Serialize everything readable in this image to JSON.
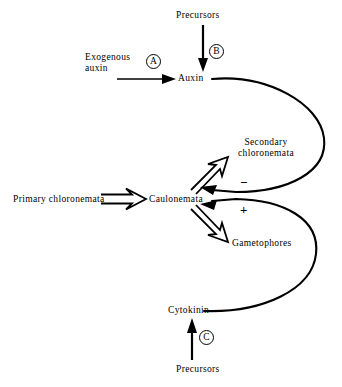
{
  "diagram": {
    "type": "flow-diagram",
    "background_color": "#ffffff",
    "line_color": "#000000",
    "nodes": [
      {
        "id": "precursors_top",
        "label": "Precursors"
      },
      {
        "id": "exogenous_auxin",
        "label": "Exogenous\nauxin",
        "line1": "Exogenous",
        "line2": "auxin"
      },
      {
        "id": "auxin",
        "label": "Auxin"
      },
      {
        "id": "primary_chloronemata",
        "label": "Primary chloronemata"
      },
      {
        "id": "caulonemata",
        "label": "Caulonemata"
      },
      {
        "id": "secondary_chloronemata",
        "label": "Secondary chloronemata",
        "line1": "Secondary",
        "line2": "chloronemata"
      },
      {
        "id": "gametophores",
        "label": "Gametophores"
      },
      {
        "id": "cytokinin",
        "label": "Cytokinin"
      },
      {
        "id": "precursors_bottom",
        "label": "Precursors"
      }
    ],
    "step_markers": [
      {
        "id": "marker_a",
        "label": "A"
      },
      {
        "id": "marker_b",
        "label": "B"
      },
      {
        "id": "marker_c",
        "label": "C"
      }
    ],
    "signs": [
      {
        "id": "sign_minus",
        "label": "−",
        "meaning": "inhibition"
      },
      {
        "id": "sign_plus",
        "label": "+",
        "meaning": "promotion"
      }
    ],
    "edges": [
      {
        "from": "precursors_top",
        "to": "auxin",
        "style": "solid-arrow",
        "marker": "B"
      },
      {
        "from": "exogenous_auxin",
        "to": "auxin",
        "style": "solid-arrow",
        "marker": "A"
      },
      {
        "from": "primary_chloronemata",
        "to": "caulonemata",
        "style": "open-double-arrow"
      },
      {
        "from": "caulonemata",
        "to": "secondary_chloronemata",
        "style": "open-double-arrow"
      },
      {
        "from": "caulonemata",
        "to": "gametophores",
        "style": "open-double-arrow"
      },
      {
        "from": "auxin",
        "to": "caulonemata",
        "style": "curved-arrow",
        "sign": "−"
      },
      {
        "from": "cytokinin",
        "to": "caulonemata",
        "style": "curved-arrow",
        "sign": "+"
      },
      {
        "from": "precursors_bottom",
        "to": "cytokinin",
        "style": "solid-arrow",
        "marker": "C"
      }
    ]
  }
}
